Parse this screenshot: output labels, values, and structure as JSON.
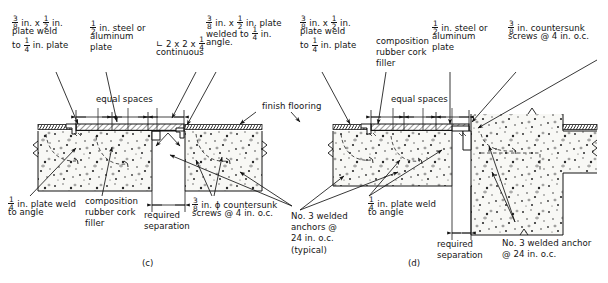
{
  "figure": {
    "title_captions": [
      {
        "label": "(c)",
        "x": 142,
        "y": 258
      },
      {
        "label": "(d)",
        "x": 408,
        "y": 258
      }
    ]
  },
  "annotations": {
    "plate_weld_quarter_left": {
      "name": "plate-weld-to-quarter-plate-left",
      "lines": [
        {
          "parts": [
            {
              "type": "frac",
              "num": "3",
              "den": "8"
            },
            {
              "type": "text",
              "value": " in. x "
            },
            {
              "type": "frac",
              "num": "1",
              "den": "2"
            },
            {
              "type": "text",
              "value": " in."
            }
          ]
        },
        {
          "parts": [
            {
              "type": "text",
              "value": "plate weld"
            }
          ]
        },
        {
          "parts": [
            {
              "type": "text",
              "value": "to "
            },
            {
              "type": "frac",
              "num": "1",
              "den": "4"
            },
            {
              "type": "text",
              "value": " in. plate"
            }
          ]
        }
      ]
    },
    "steel_or_aluminum_plate_left": {
      "name": "steel-or-aluminum-plate-left",
      "lines": [
        {
          "parts": [
            {
              "type": "frac",
              "num": "1",
              "den": "2"
            },
            {
              "type": "text",
              "value": " in. steel or"
            }
          ]
        },
        {
          "parts": [
            {
              "type": "text",
              "value": "aluminum"
            }
          ]
        },
        {
          "parts": [
            {
              "type": "text",
              "value": "plate"
            }
          ]
        }
      ]
    },
    "angle_continuous": {
      "name": "angle-2x2x-quarter-continuous",
      "lines": [
        {
          "parts": [
            {
              "type": "text",
              "value": "∟ 2 x 2 x "
            },
            {
              "type": "frac",
              "num": "1",
              "den": "4"
            }
          ]
        },
        {
          "parts": [
            {
              "type": "text",
              "value": "continuous"
            }
          ]
        }
      ]
    },
    "plate_welded_to_angle": {
      "name": "plate-welded-to-quarter-in-angle",
      "lines": [
        {
          "parts": [
            {
              "type": "frac",
              "num": "3",
              "den": "8"
            },
            {
              "type": "text",
              "value": " in. x "
            },
            {
              "type": "frac",
              "num": "1",
              "den": "2"
            },
            {
              "type": "text",
              "value": " in. plate"
            }
          ]
        },
        {
          "parts": [
            {
              "type": "text",
              "value": "welded to "
            },
            {
              "type": "frac",
              "num": "1",
              "den": "4"
            },
            {
              "type": "text",
              "value": " in."
            }
          ]
        },
        {
          "parts": [
            {
              "type": "text",
              "value": "angle."
            }
          ]
        }
      ]
    },
    "finish_flooring": {
      "name": "finish-flooring",
      "lines": [
        {
          "parts": [
            {
              "type": "text",
              "value": "finish flooring"
            }
          ]
        }
      ]
    },
    "equal_spaces_left": {
      "name": "equal-spaces-left",
      "lines": [
        {
          "parts": [
            {
              "type": "text",
              "value": "equal spaces"
            }
          ]
        }
      ]
    },
    "quarter_plate_weld_to_angle_left": {
      "name": "quarter-in-plate-weld-to-angle-left",
      "lines": [
        {
          "parts": [
            {
              "type": "frac",
              "num": "1",
              "den": "4"
            },
            {
              "type": "text",
              "value": " in. plate weld"
            }
          ]
        },
        {
          "parts": [
            {
              "type": "text",
              "value": "to angle"
            }
          ]
        }
      ]
    },
    "composition_filler_left": {
      "name": "composition-rubber-cork-filler-left",
      "lines": [
        {
          "parts": [
            {
              "type": "text",
              "value": "composition"
            }
          ]
        },
        {
          "parts": [
            {
              "type": "text",
              "value": "rubber cork"
            }
          ]
        },
        {
          "parts": [
            {
              "type": "text",
              "value": "filler"
            }
          ]
        }
      ]
    },
    "required_separation_left": {
      "name": "required-separation-left",
      "lines": [
        {
          "parts": [
            {
              "type": "text",
              "value": "required"
            }
          ]
        },
        {
          "parts": [
            {
              "type": "text",
              "value": "separation"
            }
          ]
        }
      ]
    },
    "countersunk_screws_left": {
      "name": "countersunk-screws-left",
      "lines": [
        {
          "parts": [
            {
              "type": "frac",
              "num": "3",
              "den": "8"
            },
            {
              "type": "text",
              "value": " in. ϕ countersunk"
            }
          ]
        },
        {
          "parts": [
            {
              "type": "text",
              "value": "screws @ 4 in. o.c."
            }
          ]
        }
      ]
    },
    "welded_anchors_typical": {
      "name": "no3-welded-anchors-typical",
      "lines": [
        {
          "parts": [
            {
              "type": "text",
              "value": "No. 3 welded"
            }
          ]
        },
        {
          "parts": [
            {
              "type": "text",
              "value": "anchors @"
            }
          ]
        },
        {
          "parts": [
            {
              "type": "text",
              "value": "24 in. o.c."
            }
          ]
        },
        {
          "parts": [
            {
              "type": "text",
              "value": "(typical)"
            }
          ]
        }
      ]
    },
    "plate_weld_quarter_right": {
      "name": "plate-weld-to-quarter-plate-right",
      "lines": [
        {
          "parts": [
            {
              "type": "frac",
              "num": "3",
              "den": "8"
            },
            {
              "type": "text",
              "value": " in. x "
            },
            {
              "type": "frac",
              "num": "1",
              "den": "2"
            },
            {
              "type": "text",
              "value": " in."
            }
          ]
        },
        {
          "parts": [
            {
              "type": "text",
              "value": "plate weld"
            }
          ]
        },
        {
          "parts": [
            {
              "type": "text",
              "value": "to "
            },
            {
              "type": "frac",
              "num": "1",
              "den": "4"
            },
            {
              "type": "text",
              "value": " in. plate"
            }
          ]
        }
      ]
    },
    "composition_filler_right": {
      "name": "composition-rubber-cork-filler-right",
      "lines": [
        {
          "parts": [
            {
              "type": "text",
              "value": "composition"
            }
          ]
        },
        {
          "parts": [
            {
              "type": "text",
              "value": "rubber cork"
            }
          ]
        },
        {
          "parts": [
            {
              "type": "text",
              "value": "filler"
            }
          ]
        }
      ]
    },
    "steel_or_aluminum_plate_right": {
      "name": "steel-or-aluminum-plate-right",
      "lines": [
        {
          "parts": [
            {
              "type": "frac",
              "num": "1",
              "den": "2"
            },
            {
              "type": "text",
              "value": " in. steel or"
            }
          ]
        },
        {
          "parts": [
            {
              "type": "text",
              "value": "aluminum"
            }
          ]
        },
        {
          "parts": [
            {
              "type": "text",
              "value": "plate"
            }
          ]
        }
      ]
    },
    "countersunk_screws_right": {
      "name": "countersunk-screws-right",
      "lines": [
        {
          "parts": [
            {
              "type": "frac",
              "num": "3",
              "den": "8"
            },
            {
              "type": "text",
              "value": " in. countersunk"
            }
          ]
        },
        {
          "parts": [
            {
              "type": "text",
              "value": "screws @ 4 in. o.c."
            }
          ]
        }
      ]
    },
    "equal_spaces_right": {
      "name": "equal-spaces-right",
      "lines": [
        {
          "parts": [
            {
              "type": "text",
              "value": "equal spaces"
            }
          ]
        }
      ]
    },
    "quarter_plate_weld_to_angle_right": {
      "name": "quarter-in-plate-weld-to-angle-right",
      "lines": [
        {
          "parts": [
            {
              "type": "frac",
              "num": "1",
              "den": "4"
            },
            {
              "type": "text",
              "value": " in. plate weld"
            }
          ]
        },
        {
          "parts": [
            {
              "type": "text",
              "value": "to angle"
            }
          ]
        }
      ]
    },
    "required_separation_right": {
      "name": "required-separation-right",
      "lines": [
        {
          "parts": [
            {
              "type": "text",
              "value": "required"
            }
          ]
        },
        {
          "parts": [
            {
              "type": "text",
              "value": "separation"
            }
          ]
        }
      ]
    },
    "welded_anchor_right": {
      "name": "no3-welded-anchor-right",
      "lines": [
        {
          "parts": [
            {
              "type": "text",
              "value": "No. 3 welded anchor"
            }
          ]
        },
        {
          "parts": [
            {
              "type": "text",
              "value": "@ 24 in. o.c."
            }
          ]
        }
      ]
    }
  },
  "colors": {
    "line": "#141414",
    "concrete_fill": "#f7f7f4",
    "aggregate": "#2b2b2b",
    "background": "#ffffff"
  }
}
